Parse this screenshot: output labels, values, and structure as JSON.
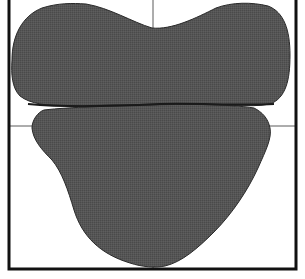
{
  "figure": {
    "kind": "two-lobed silhouette shape inside open-top frame with crosshair guide lines",
    "colors": {
      "background": "#ffffff",
      "frame": "#111111",
      "guide_lines": "#555555",
      "shape_fill": "#555555",
      "shape_outline": "#222222",
      "seam": "#1a1a1a"
    },
    "frame": {
      "left_x": 9,
      "right_x": 296,
      "bottom_y": 269,
      "top_open": true
    },
    "guides": {
      "vertical_x": 153,
      "horizontal_y": 126
    },
    "parts": [
      {
        "name": "upper-lobe"
      },
      {
        "name": "lower-lobe"
      }
    ]
  }
}
